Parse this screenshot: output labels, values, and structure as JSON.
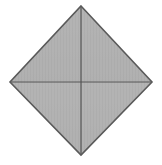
{
  "canvas": {
    "width": 162,
    "height": 165,
    "background_color": "#ffffff",
    "figure_label": "diamond"
  },
  "chart_data": {
    "type": "diagram",
    "title": "",
    "subtitle": "",
    "xlabel": "",
    "ylabel": "",
    "grid": false,
    "legend": "none",
    "annotations": [],
    "shape": {
      "name": "rhombus",
      "description": "Gray filled diamond divided into four triangular quadrants by a vertical and a horizontal median line",
      "vertex_labels": [
        "top",
        "right",
        "bottom",
        "left"
      ],
      "vertices": [
        {
          "label": "top",
          "x": 81,
          "y": 6
        },
        {
          "label": "right",
          "x": 152,
          "y": 82
        },
        {
          "label": "bottom",
          "x": 81,
          "y": 155
        },
        {
          "label": "left",
          "x": 10,
          "y": 82
        }
      ],
      "center": {
        "label": "center",
        "x": 81,
        "y": 81
      },
      "width": 142,
      "height": 149,
      "fill_color": "#b1b1b1",
      "fill_color_secondary": "#a9a9a9",
      "stroke_color": "#5a5a5a",
      "stroke_width": 1.6
    },
    "interior_lines": [
      {
        "name": "vertical-median",
        "orientation": "vertical",
        "x1": 81,
        "y1": 6,
        "x2": 81,
        "y2": 155,
        "stroke_color": "#555555",
        "stroke_width": 1.2
      },
      {
        "name": "horizontal-median",
        "orientation": "horizontal",
        "x1": 10,
        "y1": 82,
        "x2": 152,
        "y2": 82,
        "stroke_color": "#555555",
        "stroke_width": 1.2
      }
    ],
    "regions": [
      {
        "name": "quadrant-top-left",
        "fill_color": "#b1b1b1"
      },
      {
        "name": "quadrant-top-right",
        "fill_color": "#b1b1b1"
      },
      {
        "name": "quadrant-bottom-right",
        "fill_color": "#aeaeae"
      },
      {
        "name": "quadrant-bottom-left",
        "fill_color": "#aeaeae"
      }
    ],
    "texture": {
      "name": "vertical-stripe",
      "period_px": 3,
      "light": "#b4b4b4",
      "dark": "#ababab"
    }
  }
}
